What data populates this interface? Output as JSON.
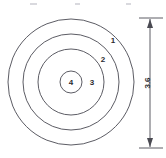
{
  "figure": {
    "type": "concentric-zone-target-diagram",
    "background_color": "#ffffff",
    "line_color": "#4a4a52",
    "text_color": "#2b2b30",
    "zones": [
      {
        "id": "zone-1",
        "label": "1",
        "ring_index": 1,
        "position": "outermost-ring",
        "label_x": 113,
        "label_y": 43,
        "radius": 63
      },
      {
        "id": "zone-2",
        "label": "2",
        "ring_index": 2,
        "position": "second-ring",
        "label_x": 103,
        "label_y": 62,
        "radius": 48
      },
      {
        "id": "zone-3",
        "label": "3",
        "ring_index": 3,
        "position": "third-ring",
        "label_x": 92,
        "label_y": 84,
        "radius": 33
      },
      {
        "id": "zone-4",
        "label": "4",
        "ring_index": 4,
        "position": "innermost-circle",
        "label_x": 75,
        "label_y": 84,
        "radius": 11
      }
    ],
    "center": {
      "cx": 71,
      "cy": 82
    },
    "dimension": {
      "id": "overall-height",
      "value": "3.6",
      "orientation": "vertical",
      "text_rotation_deg": -90,
      "line_x": 150,
      "top_y": 20,
      "bottom_y": 146,
      "text_x": 150,
      "text_y": 83,
      "extension_top_y": 18,
      "extension_bottom_y": 148,
      "extension_x1": 139,
      "extension_x2": 163
    },
    "specks": [
      {
        "x": 30,
        "y": 3,
        "w": 7,
        "h": 2
      },
      {
        "x": 75,
        "y": 3,
        "w": 5,
        "h": 2
      },
      {
        "x": 126,
        "y": 3,
        "w": 5,
        "h": 2
      }
    ]
  }
}
